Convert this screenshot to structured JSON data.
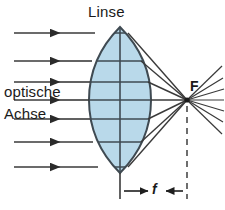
{
  "diagram": {
    "title": "Linse",
    "background_color": "#ffffff",
    "labels": {
      "lens": "Linse",
      "axis_line1": "optische",
      "axis_line2": "Achse",
      "focal_point": "F",
      "focal_length": "f"
    },
    "colors": {
      "lens_fill": "#b9d9ea",
      "lens_stroke": "#3f4a52",
      "ray_stroke": "#3a3a3a",
      "text": "#1a1a1a",
      "dashed_line": "#4a4a4a"
    },
    "geometry": {
      "optical_axis_y": 100,
      "lens_center_x": 120,
      "lens_top_y": 27,
      "lens_bottom_y": 173,
      "lens_left_edge_x": 89,
      "lens_right_edge_x": 151,
      "focal_point_x": 187,
      "focal_point_y": 100,
      "dimension_line_y": 191,
      "ray_start_x": 14,
      "ray_count_incoming": 7,
      "diverging_ray_end_x": 222
    },
    "incoming_rays": [
      {
        "y": 33,
        "arrow_x": 56
      },
      {
        "y": 61,
        "arrow_x": 56
      },
      {
        "y": 82,
        "arrow_x": 56
      },
      {
        "y": 100,
        "arrow_x": 56
      },
      {
        "y": 119,
        "arrow_x": 56
      },
      {
        "y": 142,
        "arrow_x": 56
      },
      {
        "y": 167,
        "arrow_x": 56
      }
    ],
    "refracted_rays": [
      {
        "exit_y": 33
      },
      {
        "exit_y": 61
      },
      {
        "exit_y": 82
      },
      {
        "exit_y": 100
      },
      {
        "exit_y": 119
      },
      {
        "exit_y": 142
      },
      {
        "exit_y": 167
      }
    ]
  }
}
